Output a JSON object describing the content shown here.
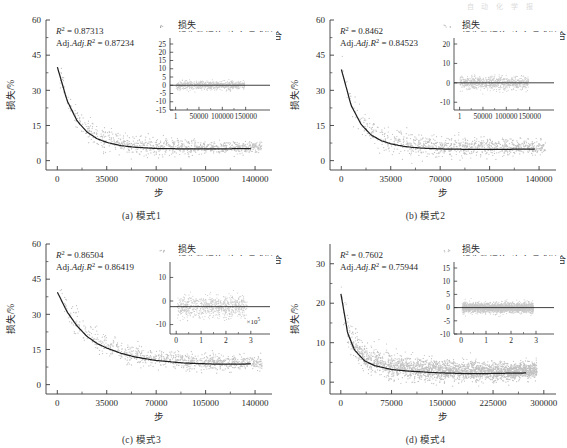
{
  "header": {
    "watermark": "自 动 化 学 报"
  },
  "figure": {
    "legend": {
      "scatter_label": "损失",
      "fit_label": "损失数据的9次多项式拟合"
    },
    "axis_labels": {
      "x": "步",
      "y": "损失/%"
    },
    "colors": {
      "scatter": "#9a9a9a",
      "fit_line": "#1f1f1f",
      "axis": "#3a3a3a",
      "inset_bg": "#ffffff",
      "text": "#2b2b2b"
    }
  },
  "chart_data": [
    {
      "type": "scatter",
      "panel": "a",
      "caption": "(a) 模式1",
      "title": "",
      "xlabel": "步",
      "ylabel": "损失/%",
      "xlim": [
        -8000,
        152000
      ],
      "ylim": [
        -4,
        60
      ],
      "xticks": [
        0,
        35000,
        70000,
        105000,
        140000
      ],
      "xticklabels": [
        "0",
        "35000",
        "70000",
        "105000",
        "140000"
      ],
      "yticks": [
        0,
        15,
        30,
        45,
        60
      ],
      "yticklabels": [
        "0",
        "15",
        "30",
        "45",
        "60"
      ],
      "grid": false,
      "legend_position": "top-right",
      "stats": {
        "r2_label": "R",
        "r2_value": "0.87313",
        "adj_label": "Adj.R",
        "adj_value": "0.87234"
      },
      "series": [
        {
          "name": "损失",
          "marker": "dot",
          "n_points": 900
        },
        {
          "name": "损失数据的9次多项式拟合",
          "type": "line"
        }
      ],
      "fit_curve": {
        "x": [
          0,
          7000,
          14000,
          21000,
          28000,
          35000,
          45000,
          55000,
          70000,
          90000,
          110000,
          130000,
          145000
        ],
        "y": [
          40.0,
          25.5,
          17.0,
          12.2,
          9.4,
          7.8,
          6.4,
          5.7,
          5.2,
          5.0,
          5.0,
          5.1,
          5.3
        ]
      },
      "scatter_spread": {
        "start": 6.0,
        "end": 1.9
      },
      "inset": {
        "type": "scatter",
        "xlim": [
          -12000,
          185000
        ],
        "ylim": [
          -15,
          25
        ],
        "xticks": [
          1,
          50000,
          100000,
          150000
        ],
        "xticklabels": [
          "1",
          "50000",
          "100000",
          "150000"
        ],
        "yticks": [
          25,
          20,
          15,
          10,
          5,
          0,
          -5,
          -10,
          -15
        ],
        "yticklabels": [
          "25",
          "20",
          "15",
          "10",
          "5",
          "0",
          "-5",
          "-10",
          "-15"
        ],
        "zero_line": 0,
        "residual_spread": 2.2,
        "data_x_end": 148000,
        "exponent_label": ""
      }
    },
    {
      "type": "scatter",
      "panel": "b",
      "caption": "(b) 模式2",
      "title": "",
      "xlabel": "步",
      "ylabel": "损失/%",
      "xlim": [
        -8000,
        152000
      ],
      "ylim": [
        -4,
        60
      ],
      "xticks": [
        0,
        35000,
        70000,
        105000,
        140000
      ],
      "xticklabels": [
        "0",
        "35000",
        "70000",
        "105000",
        "140000"
      ],
      "yticks": [
        0,
        15,
        30,
        45,
        60
      ],
      "yticklabels": [
        "0",
        "15",
        "30",
        "45",
        "60"
      ],
      "grid": false,
      "legend_position": "top-right",
      "stats": {
        "r2_label": "R",
        "r2_value": "0.8462",
        "adj_label": "Adj.R",
        "adj_value": "0.84523"
      },
      "series": [
        {
          "name": "损失",
          "marker": "dot",
          "n_points": 950
        },
        {
          "name": "损失数据的9次多项式拟合",
          "type": "line"
        }
      ],
      "fit_curve": {
        "x": [
          0,
          7000,
          14000,
          21000,
          28000,
          35000,
          45000,
          55000,
          70000,
          90000,
          110000,
          130000,
          145000
        ],
        "y": [
          39.0,
          23.5,
          15.5,
          11.0,
          8.6,
          7.2,
          6.0,
          5.4,
          5.0,
          4.8,
          4.8,
          4.9,
          5.0
        ]
      },
      "scatter_spread": {
        "start": 6.0,
        "end": 2.6
      },
      "inset": {
        "type": "scatter",
        "xlim": [
          -12000,
          185000
        ],
        "ylim": [
          -14,
          20
        ],
        "xticks": [
          1,
          50000,
          100000,
          150000
        ],
        "xticklabels": [
          "1",
          "50000",
          "100000",
          "150000"
        ],
        "yticks": [
          20,
          10,
          0,
          -10
        ],
        "yticklabels": [
          "20",
          "10",
          "0",
          "-10"
        ],
        "zero_line": 0,
        "residual_spread": 3.0,
        "data_x_end": 148000,
        "exponent_label": ""
      }
    },
    {
      "type": "scatter",
      "panel": "c",
      "caption": "(c) 模式3",
      "title": "",
      "xlabel": "步",
      "ylabel": "损失/%",
      "xlim": [
        -8000,
        152000
      ],
      "ylim": [
        -4,
        60
      ],
      "xticks": [
        0,
        35000,
        70000,
        105000,
        140000
      ],
      "xticklabels": [
        "0",
        "35000",
        "70000",
        "105000",
        "140000"
      ],
      "yticks": [
        0,
        15,
        30,
        45,
        60
      ],
      "yticklabels": [
        "0",
        "15",
        "30",
        "45",
        "60"
      ],
      "grid": false,
      "legend_position": "top-right",
      "stats": {
        "r2_label": "R",
        "r2_value": "0.86504",
        "adj_label": "Adj.R",
        "adj_value": "0.86419"
      },
      "series": [
        {
          "name": "损失",
          "marker": "dot",
          "n_points": 900
        },
        {
          "name": "损失数据的9次多项式拟合",
          "type": "line"
        }
      ],
      "fit_curve": {
        "x": [
          0,
          7000,
          14000,
          21000,
          28000,
          35000,
          45000,
          55000,
          70000,
          90000,
          110000,
          130000,
          145000
        ],
        "y": [
          39.5,
          31.0,
          25.0,
          20.6,
          17.6,
          15.6,
          13.4,
          11.8,
          10.3,
          9.2,
          8.8,
          8.8,
          8.9
        ]
      },
      "scatter_spread": {
        "start": 5.5,
        "end": 2.4
      },
      "inset": {
        "type": "scatter",
        "xlim": [
          -0.25,
          3.45
        ],
        "ylim": [
          -14,
          14
        ],
        "xticks": [
          0,
          1,
          2,
          3
        ],
        "xticklabels": [
          "0",
          "1",
          "2",
          "3"
        ],
        "yticks": [
          10,
          0,
          -10
        ],
        "yticklabels": [
          "10",
          "0",
          "-10"
        ],
        "zero_line": -2.4,
        "residual_spread": 4.2,
        "data_x_end": 2.85,
        "exponent_label": "×10"
      }
    },
    {
      "type": "scatter",
      "panel": "d",
      "caption": "(d) 模式4",
      "title": "",
      "xlabel": "步",
      "ylabel": "损失/%",
      "xlim": [
        -16000,
        318000
      ],
      "ylim": [
        -3,
        35
      ],
      "xticks": [
        0,
        75000,
        150000,
        225000,
        300000
      ],
      "xticklabels": [
        "0",
        "75000",
        "150000",
        "225000",
        "300000"
      ],
      "yticks": [
        0,
        10,
        20,
        30
      ],
      "yticklabels": [
        "0",
        "10",
        "20",
        "30"
      ],
      "grid": false,
      "legend_position": "top-right",
      "stats": {
        "r2_label": "R",
        "r2_value": "0.7602",
        "adj_label": "Adj.R",
        "adj_value": "0.75944"
      },
      "series": [
        {
          "name": "损失",
          "marker": "dot",
          "n_points": 2600
        },
        {
          "name": "损失数据的9次多项式拟合",
          "type": "line"
        }
      ],
      "fit_curve": {
        "x": [
          0,
          10000,
          20000,
          35000,
          50000,
          75000,
          100000,
          140000,
          180000,
          220000,
          260000,
          290000
        ],
        "y": [
          22.5,
          12.5,
          8.2,
          5.4,
          4.2,
          3.2,
          2.8,
          2.4,
          2.2,
          2.2,
          2.3,
          2.4
        ]
      },
      "scatter_spread": {
        "start": 4.0,
        "end": 1.7
      },
      "inset": {
        "type": "scatter",
        "xlim": [
          -0.28,
          3.4
        ],
        "ylim": [
          -10,
          15
        ],
        "xticks": [
          0,
          1,
          2,
          3
        ],
        "xticklabels": [
          "0",
          "1",
          "2",
          "3"
        ],
        "yticks": [
          15,
          10,
          5,
          0,
          -5,
          -10
        ],
        "yticklabels": [
          "15",
          "10",
          "5",
          "0",
          "-5",
          "-10"
        ],
        "zero_line": 0,
        "residual_spread": 1.7,
        "data_x_end": 2.9,
        "exponent_label": ""
      }
    }
  ]
}
